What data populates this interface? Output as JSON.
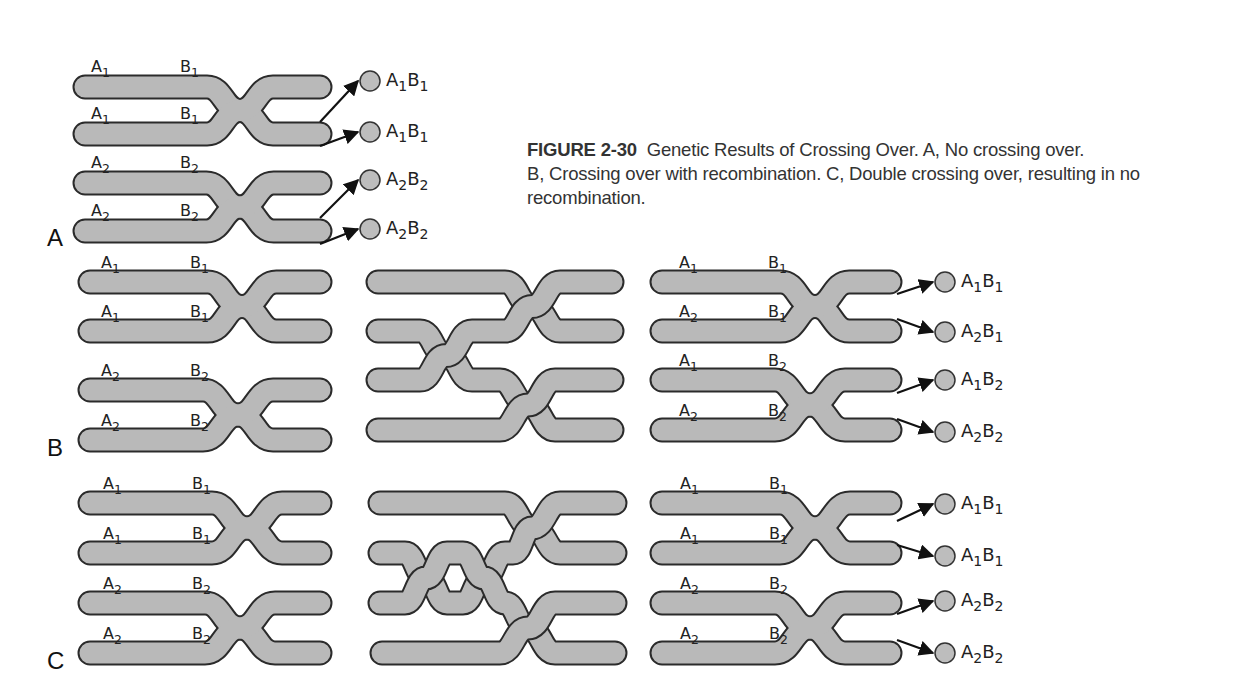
{
  "caption": {
    "figure_number": "FIGURE 2-30",
    "title": "Genetic Results of Crossing Over.",
    "parts": [
      {
        "letter": "A,",
        "text": " No crossing over."
      },
      {
        "letter": "B,",
        "text": " Crossing over with recombination."
      },
      {
        "letter": "C,",
        "text": " Double crossing over, resulting in no recombination."
      }
    ]
  },
  "colors": {
    "chromatid_fill": "#b9b9b9",
    "chromatid_outline": "#2b2b2b",
    "gamete_fill": "#bdbdbd",
    "text": "#222222"
  },
  "panels": [
    {
      "letter": "A",
      "stages": [
        {
          "name": "synapsis",
          "chromatids": [
            {
              "a": "A1",
              "b": "B1"
            },
            {
              "a": "A1",
              "b": "B1"
            },
            {
              "a": "A2",
              "b": "B2"
            },
            {
              "a": "A2",
              "b": "B2"
            }
          ]
        }
      ],
      "gametes": [
        "A1B1",
        "A1B1",
        "A2B2",
        "A2B2"
      ]
    },
    {
      "letter": "B",
      "stages": [
        {
          "name": "before",
          "chromatids": [
            {
              "a": "A1",
              "b": "B1"
            },
            {
              "a": "A1",
              "b": "B1"
            },
            {
              "a": "A2",
              "b": "B2"
            },
            {
              "a": "A2",
              "b": "B2"
            }
          ]
        },
        {
          "name": "single-crossover",
          "chromatids": []
        },
        {
          "name": "after",
          "chromatids": [
            {
              "a": "A1",
              "b": "B1"
            },
            {
              "a": "A2",
              "b": "B1"
            },
            {
              "a": "A1",
              "b": "B2"
            },
            {
              "a": "A2",
              "b": "B2"
            }
          ]
        }
      ],
      "gametes": [
        "A1B1",
        "A2B1",
        "A1B2",
        "A2B2"
      ]
    },
    {
      "letter": "C",
      "stages": [
        {
          "name": "before",
          "chromatids": [
            {
              "a": "A1",
              "b": "B1"
            },
            {
              "a": "A1",
              "b": "B1"
            },
            {
              "a": "A2",
              "b": "B2"
            },
            {
              "a": "A2",
              "b": "B2"
            }
          ]
        },
        {
          "name": "double-crossover",
          "chromatids": []
        },
        {
          "name": "after",
          "chromatids": [
            {
              "a": "A1",
              "b": "B1"
            },
            {
              "a": "A1",
              "b": "B1"
            },
            {
              "a": "A2",
              "b": "B2"
            },
            {
              "a": "A2",
              "b": "B2"
            }
          ]
        }
      ],
      "gametes": [
        "A1B1",
        "A1B1",
        "A2B2",
        "A2B2"
      ]
    }
  ]
}
